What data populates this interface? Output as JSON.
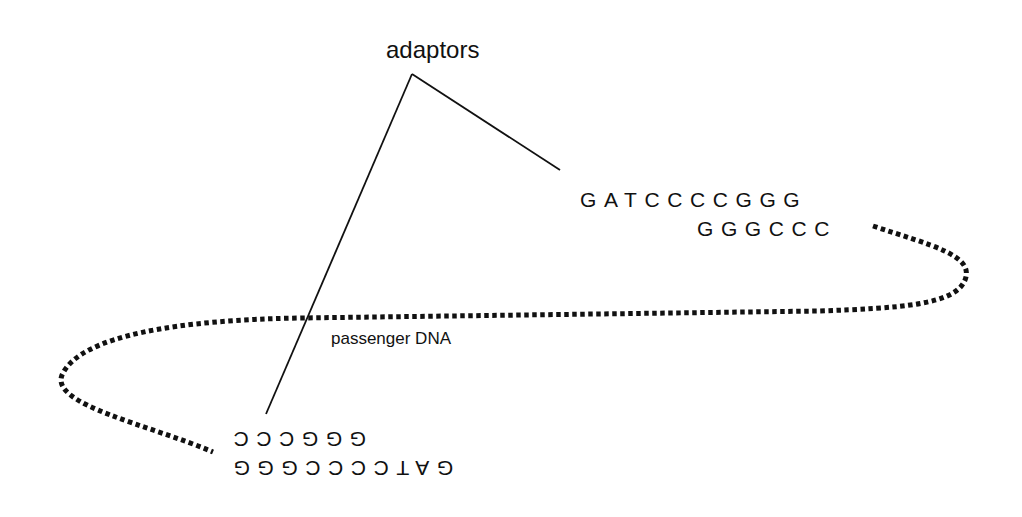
{
  "diagram": {
    "labels": {
      "adaptors": "adaptors",
      "passenger": "passenger DNA"
    },
    "top_adaptor": {
      "strand1": "GATCCCCGGG",
      "strand2": "GGGCCC"
    },
    "bottom_adaptor_rotated_180": {
      "strand1": "GGGCCC",
      "strand2": "GATCCCCGGG"
    },
    "colors": {
      "ink": "#111111",
      "background": "#ffffff"
    },
    "elements": {
      "pointer_lines": "two solid lines from 'adaptors' label apex to each adaptor",
      "passenger_dna": "dotted loop connecting the two adaptors"
    }
  }
}
